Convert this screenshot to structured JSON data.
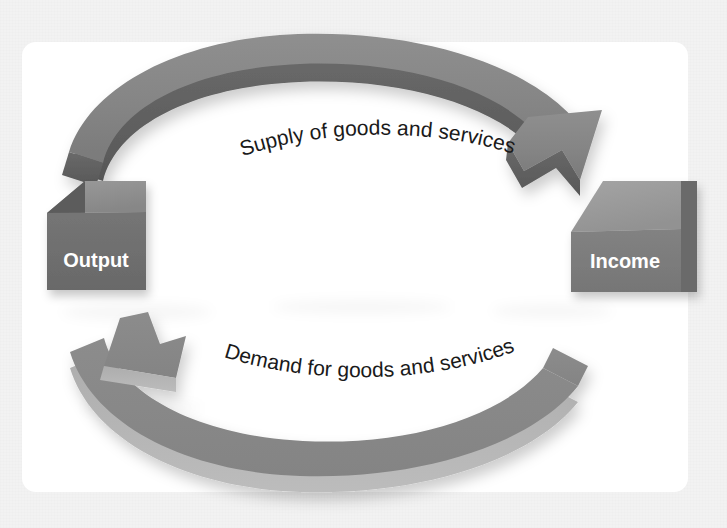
{
  "figure": {
    "kind": "circular-flow",
    "background_color": "#f2f2f2",
    "card_color": "#ffffff",
    "nodes": [
      {
        "id": "output",
        "label": "Output",
        "shape": "cube",
        "position": "left",
        "label_color": "#ffffff",
        "face_top_color": "#8e8e8e",
        "face_front_color": "#6f6f6f",
        "face_side_color": "#5b5b5b"
      },
      {
        "id": "income",
        "label": "Income",
        "shape": "cube",
        "position": "right",
        "label_color": "#ffffff",
        "face_top_color": "#9a9a9a",
        "face_front_color": "#7c7c7c",
        "face_side_color": "#636363"
      }
    ],
    "flows": [
      {
        "id": "supply",
        "label": "Supply of goods and services",
        "direction": "left-to-right",
        "position": "top",
        "label_color": "#1a1a1a",
        "band_color": "#8a8a8a",
        "band_shade_color": "#5e5e5e"
      },
      {
        "id": "demand",
        "label": "Demand for goods and services",
        "direction": "right-to-left",
        "position": "bottom",
        "label_color": "#1a1a1a",
        "band_color": "#8a8a8a",
        "band_shade_color": "#a8a8a8"
      }
    ]
  }
}
